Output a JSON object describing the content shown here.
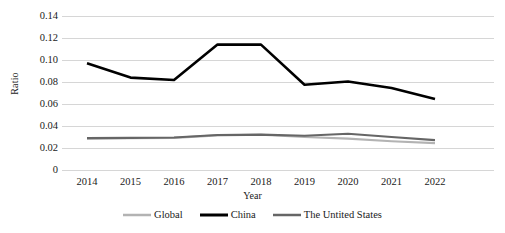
{
  "chart_data": {
    "type": "line",
    "title": "",
    "xlabel": "Year",
    "ylabel": "Ratio",
    "categories": [
      "2014",
      "2015",
      "2016",
      "2017",
      "2018",
      "2019",
      "2020",
      "2021",
      "2022"
    ],
    "ylim": [
      0,
      0.14
    ],
    "ytick_step": 0.02,
    "ytick_labels": [
      "0.14",
      "0.12",
      "0.10",
      "0.08",
      "0.06",
      "0.04",
      "0.02",
      "0"
    ],
    "ytick_values": [
      0.14,
      0.12,
      0.1,
      0.08,
      0.06,
      0.04,
      0.02,
      0
    ],
    "grid": "horizontal",
    "legend_position": "bottom",
    "series": [
      {
        "name": "Global",
        "color": "#b3b3b3",
        "width": 2.1,
        "values": [
          0.0285,
          0.0288,
          0.0292,
          0.0315,
          0.032,
          0.03,
          0.0285,
          0.0262,
          0.0244
        ]
      },
      {
        "name": "China",
        "color": "#000000",
        "width": 2.6,
        "values": [
          0.097,
          0.084,
          0.0818,
          0.114,
          0.114,
          0.0775,
          0.0805,
          0.0745,
          0.0645
        ]
      },
      {
        "name": "The Untited States",
        "color": "#666666",
        "width": 2.1,
        "values": [
          0.029,
          0.0292,
          0.0296,
          0.0318,
          0.0322,
          0.0312,
          0.033,
          0.03,
          0.0272
        ]
      }
    ]
  },
  "axis_colors": {
    "gridline": "#d6d6d6",
    "text": "#1a1a1a"
  }
}
